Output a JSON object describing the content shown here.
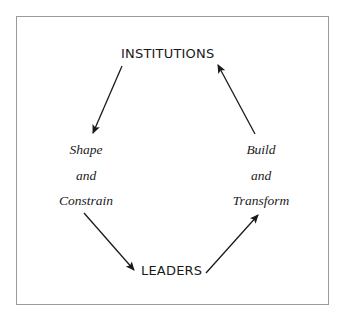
{
  "diagram": {
    "nodes": {
      "top": "INSTITUTIONS",
      "bottom": "LEADERS"
    },
    "left_label": {
      "line1": "Shape",
      "line2": "and",
      "line3": "Constrain"
    },
    "right_label": {
      "line1": "Build",
      "line2": "and",
      "line3": "Transform"
    },
    "edges": [
      {
        "from": "INSTITUTIONS",
        "to": "LEADERS",
        "label": "Shape and Constrain"
      },
      {
        "from": "LEADERS",
        "to": "INSTITUTIONS",
        "label": "Build and Transform"
      }
    ],
    "colors": {
      "text": "#1a1a1a",
      "arrow": "#1a1a1a",
      "border": "#9a9a9a"
    }
  }
}
